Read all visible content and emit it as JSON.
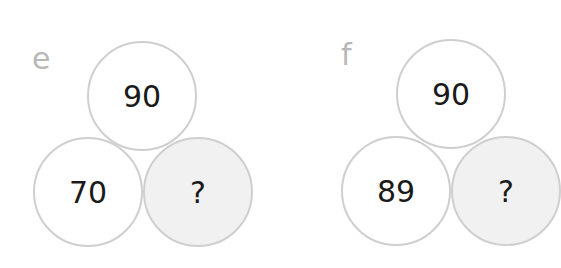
{
  "panels": [
    {
      "label": "e",
      "top": "90",
      "bottom_left": "70",
      "bottom_right": "?"
    },
    {
      "label": "f",
      "top": "90",
      "bottom_left": "89",
      "bottom_right": "?"
    }
  ],
  "colors": {
    "circle_border": "#cfcfcf",
    "unknown_fill": "#f1f1f1",
    "label": "#b8b8b8",
    "text": "#1a1a1a"
  }
}
